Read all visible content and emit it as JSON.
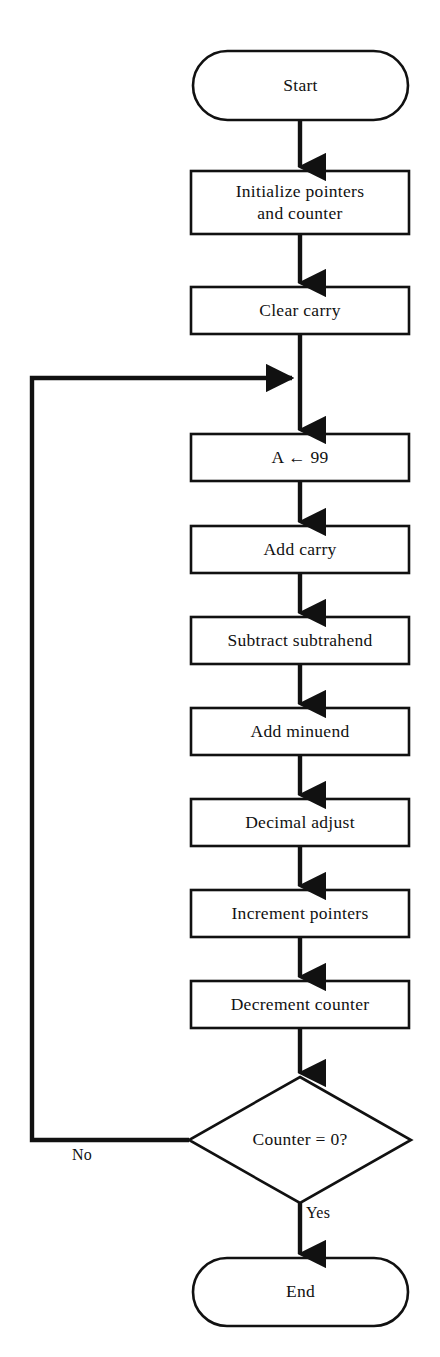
{
  "diagram": {
    "background_color": "#ffffff",
    "stroke_color": "#111111",
    "text_color": "#111111",
    "nodes": [
      {
        "id": "start",
        "shape": "terminator",
        "label": "Start"
      },
      {
        "id": "init",
        "shape": "process",
        "label": "Initialize pointers\nand counter"
      },
      {
        "id": "clear",
        "shape": "process",
        "label": "Clear carry"
      },
      {
        "id": "load",
        "shape": "process",
        "label": "A ← 99"
      },
      {
        "id": "addcarry",
        "shape": "process",
        "label": "Add carry"
      },
      {
        "id": "subtract",
        "shape": "process",
        "label": "Subtract subtrahend"
      },
      {
        "id": "addmin",
        "shape": "process",
        "label": "Add minuend"
      },
      {
        "id": "decadj",
        "shape": "process",
        "label": "Decimal adjust"
      },
      {
        "id": "incptr",
        "shape": "process",
        "label": "Increment pointers"
      },
      {
        "id": "deccnt",
        "shape": "process",
        "label": "Decrement counter"
      },
      {
        "id": "decision",
        "shape": "decision",
        "label": "Counter = 0?"
      },
      {
        "id": "end",
        "shape": "terminator",
        "label": "End"
      }
    ],
    "edge_labels": [
      {
        "id": "no",
        "label": "No"
      },
      {
        "id": "yes",
        "label": "Yes"
      }
    ]
  }
}
